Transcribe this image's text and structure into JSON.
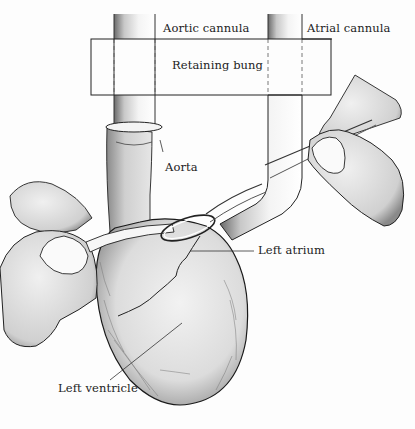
{
  "figure": {
    "labels": {
      "aortic_cannula": "Aortic cannula",
      "atrial_cannula": "Atrial cannula",
      "retaining_bung": "Retaining bung",
      "aorta": "Aorta",
      "left_atrium": "Left atrium",
      "left_ventricle": "Left ventricle"
    },
    "colors": {
      "ink": "#1a1a1a",
      "shade": "#9a9a9a",
      "paper": "#fdfdfd",
      "tissue": "#e8e8e8"
    }
  }
}
